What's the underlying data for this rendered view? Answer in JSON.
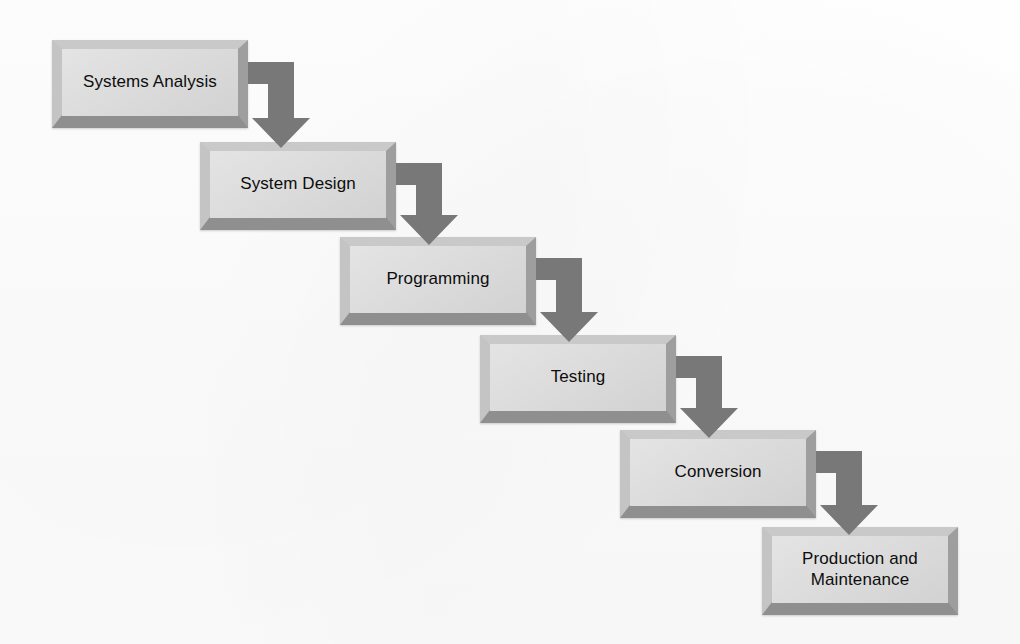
{
  "diagram": {
    "type": "waterfall-process-flow",
    "title": "",
    "background_color": "#fdfdfd",
    "box_fill_color": "#dcdcdc",
    "box_bevel_color": "#b3b3b3",
    "arrow_color": "#787878",
    "text_color": "#0d0d0d",
    "stages": [
      {
        "id": "systems-analysis",
        "label": "Systems Analysis",
        "order": 1,
        "x": 52,
        "y": 40,
        "width": 196,
        "height": 88
      },
      {
        "id": "system-design",
        "label": "System Design",
        "order": 2,
        "x": 200,
        "y": 142,
        "width": 196,
        "height": 88
      },
      {
        "id": "programming",
        "label": "Programming",
        "order": 3,
        "x": 340,
        "y": 237,
        "width": 196,
        "height": 88
      },
      {
        "id": "testing",
        "label": "Testing",
        "order": 4,
        "x": 480,
        "y": 335,
        "width": 196,
        "height": 88
      },
      {
        "id": "conversion",
        "label": "Conversion",
        "order": 5,
        "x": 620,
        "y": 430,
        "width": 196,
        "height": 88
      },
      {
        "id": "production-and-maintenance",
        "label": "Production and\nMaintenance",
        "order": 6,
        "x": 762,
        "y": 527,
        "width": 196,
        "height": 88
      }
    ],
    "connectors": [
      {
        "id": "arrow-analysis-to-design",
        "from": "systems-analysis",
        "to": "system-design",
        "shape": "elbow-right-down",
        "x": 248,
        "y": 62,
        "width": 62,
        "height": 86
      },
      {
        "id": "arrow-design-to-programming",
        "from": "system-design",
        "to": "programming",
        "shape": "elbow-right-down",
        "x": 396,
        "y": 163,
        "width": 62,
        "height": 82
      },
      {
        "id": "arrow-programming-to-testing",
        "from": "programming",
        "to": "testing",
        "shape": "elbow-right-down",
        "x": 536,
        "y": 258,
        "width": 62,
        "height": 84
      },
      {
        "id": "arrow-testing-to-conversion",
        "from": "testing",
        "to": "conversion",
        "shape": "elbow-right-down",
        "x": 676,
        "y": 356,
        "width": 62,
        "height": 82
      },
      {
        "id": "arrow-conversion-to-production",
        "from": "conversion",
        "to": "production-and-maintenance",
        "shape": "elbow-right-down",
        "x": 816,
        "y": 451,
        "width": 62,
        "height": 84
      }
    ]
  }
}
